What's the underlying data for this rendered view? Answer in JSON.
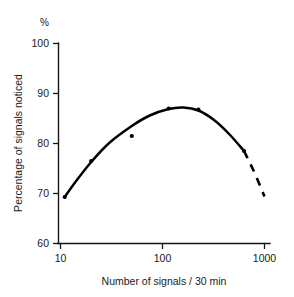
{
  "chart_data": {
    "type": "line",
    "title": "",
    "xlabel": "Number of signals / 30 min",
    "ylabel": "Percentage of signals noticed",
    "unit_label": "%",
    "xscale": "log",
    "xlim": [
      10,
      1000
    ],
    "ylim": [
      60,
      100
    ],
    "xticks": [
      10,
      100,
      1000
    ],
    "xtick_labels": [
      "10",
      "100",
      "1000"
    ],
    "yticks": [
      60,
      70,
      80,
      90,
      100
    ],
    "ytick_labels": [
      "60",
      "70",
      "80",
      "90",
      "100"
    ],
    "grid": false,
    "legend": "none",
    "points": [
      {
        "x": 11,
        "y": 69.3
      },
      {
        "x": 20,
        "y": 76.5
      },
      {
        "x": 50,
        "y": 81.5
      },
      {
        "x": 115,
        "y": 87.0
      },
      {
        "x": 225,
        "y": 86.8
      },
      {
        "x": 630,
        "y": 78.5
      }
    ],
    "fitted_curve": {
      "style_solid": "solid fitted curve through data",
      "style_extrapolation": "dashed extrapolation beyond last point",
      "series": [
        {
          "x": 11,
          "y": 69.3
        },
        {
          "x": 14,
          "y": 72.3
        },
        {
          "x": 20,
          "y": 76.3
        },
        {
          "x": 30,
          "y": 80.1
        },
        {
          "x": 50,
          "y": 83.5
        },
        {
          "x": 75,
          "y": 85.6
        },
        {
          "x": 115,
          "y": 86.9
        },
        {
          "x": 160,
          "y": 87.2
        },
        {
          "x": 225,
          "y": 86.6
        },
        {
          "x": 320,
          "y": 84.7
        },
        {
          "x": 450,
          "y": 81.9
        },
        {
          "x": 630,
          "y": 78.5
        },
        {
          "x": 780,
          "y": 74.6
        },
        {
          "x": 1000,
          "y": 69.4
        }
      ],
      "dash_start_x": 630
    }
  },
  "axis": {
    "y_unit": "%",
    "y_title": "Percentage of signals noticed",
    "x_title": "Number of signals / 30 min",
    "ytick_0": "60",
    "ytick_1": "70",
    "ytick_2": "80",
    "ytick_3": "90",
    "ytick_4": "100",
    "xtick_0": "10",
    "xtick_1": "100",
    "xtick_2": "1000"
  },
  "colors": {
    "curve": "#000000",
    "axis": "#151515",
    "text": "#1a1a1a",
    "background": "#ffffff"
  }
}
